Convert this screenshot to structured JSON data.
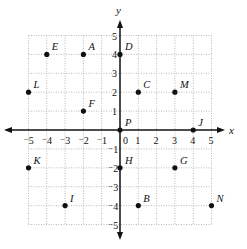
{
  "chart_data": {
    "type": "scatter",
    "title": "",
    "xlabel": "x",
    "ylabel": "y",
    "xlim": [
      -5,
      5
    ],
    "ylim": [
      -5,
      5
    ],
    "grid": true,
    "origin_label": "0",
    "x_ticks": [
      -5,
      -4,
      -3,
      -2,
      -1,
      1,
      2,
      3,
      4,
      5
    ],
    "y_ticks": [
      -5,
      -4,
      -3,
      -2,
      -1,
      1,
      2,
      3,
      4,
      5
    ],
    "points": [
      {
        "label": "A",
        "x": -2,
        "y": 4
      },
      {
        "label": "B",
        "x": 1,
        "y": -4
      },
      {
        "label": "C",
        "x": 1,
        "y": 2
      },
      {
        "label": "D",
        "x": 0,
        "y": 4
      },
      {
        "label": "E",
        "x": -4,
        "y": 4
      },
      {
        "label": "F",
        "x": -2,
        "y": 1
      },
      {
        "label": "G",
        "x": 3,
        "y": -2
      },
      {
        "label": "H",
        "x": 0,
        "y": -2
      },
      {
        "label": "I",
        "x": -3,
        "y": -4
      },
      {
        "label": "J",
        "x": 4,
        "y": 0
      },
      {
        "label": "K",
        "x": -5,
        "y": -2
      },
      {
        "label": "L",
        "x": -5,
        "y": 2
      },
      {
        "label": "M",
        "x": 3,
        "y": 2
      },
      {
        "label": "N",
        "x": 5,
        "y": -4
      },
      {
        "label": "P",
        "x": 0,
        "y": 0
      }
    ]
  },
  "colors": {
    "axis": "#111111",
    "grid": "#aaaaaa",
    "point": "#111111"
  }
}
